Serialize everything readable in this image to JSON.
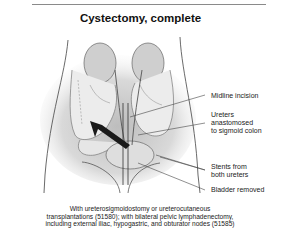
{
  "title": "Cystectomy, complete",
  "labels": {
    "midline_incision": "Midline incision",
    "ureters_line1": "Ureters",
    "ureters_line2": "anastomosed",
    "ureters_line3": "to sigmoid colon",
    "stents_line1": "Stents from",
    "stents_line2": "both ureters",
    "bladder_removed": "Bladder removed"
  },
  "caption": {
    "line1": "With ureterosigmoidostomy or ureterocutaneous",
    "line2": "transplantations (51580); with bilateral pelvic lymphadenectomy,",
    "line3": "including external iliac, hypogastric, and obturator nodes (51585)"
  },
  "colors": {
    "background": "#ffffff",
    "text": "#222222",
    "shading": "#d8d8d8",
    "arrow": "#1a1a1a"
  }
}
